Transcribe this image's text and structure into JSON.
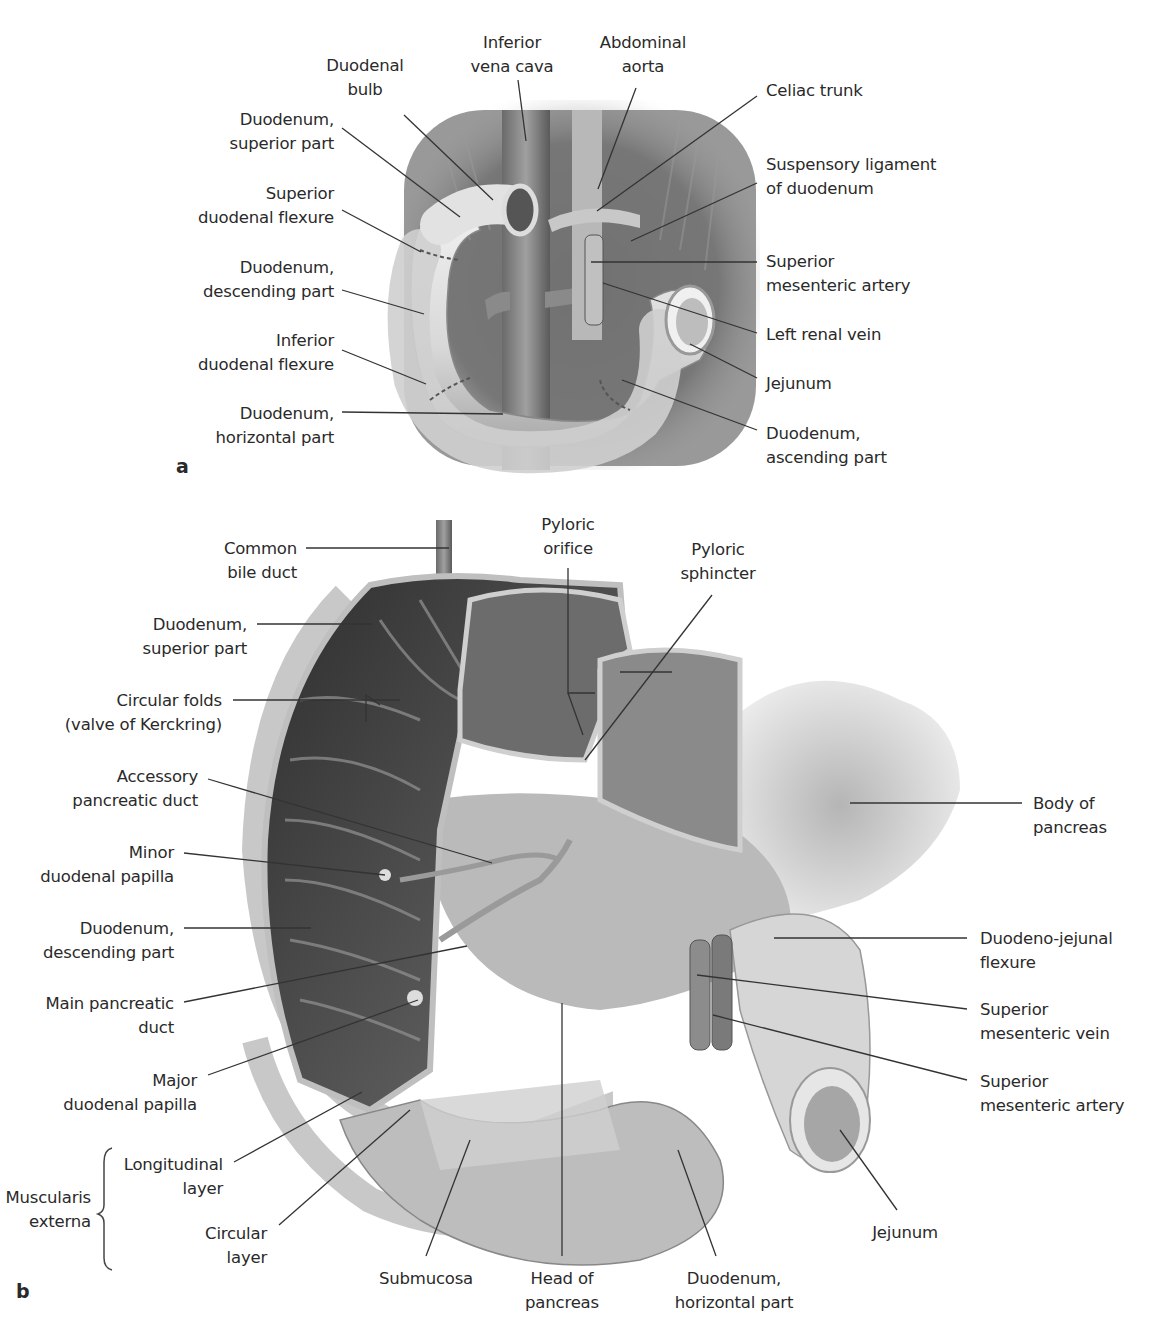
{
  "figure": {
    "panel_a": {
      "letter": "a",
      "labels": {
        "duodenal_bulb": [
          "Duodenal",
          "bulb"
        ],
        "inferior_vena_cava": [
          "Inferior",
          "vena cava"
        ],
        "abdominal_aorta": [
          "Abdominal",
          "aorta"
        ],
        "celiac_trunk": [
          "Celiac trunk"
        ],
        "suspensory_ligament": [
          "Suspensory ligament",
          "of duodenum"
        ],
        "duodenum_superior": [
          "Duodenum,",
          "superior part"
        ],
        "superior_flexure": [
          "Superior",
          "duodenal flexure"
        ],
        "duodenum_descending": [
          "Duodenum,",
          "descending part"
        ],
        "inferior_flexure": [
          "Inferior",
          "duodenal flexure"
        ],
        "duodenum_horizontal": [
          "Duodenum,",
          "horizontal part"
        ],
        "superior_mesenteric_artery": [
          "Superior",
          "mesenteric artery"
        ],
        "left_renal_vein": [
          "Left renal vein"
        ],
        "jejunum": [
          "Jejunum"
        ],
        "duodenum_ascending": [
          "Duodenum,",
          "ascending part"
        ]
      }
    },
    "panel_b": {
      "letter": "b",
      "labels": {
        "common_bile_duct": [
          "Common",
          "bile duct"
        ],
        "pyloric_orifice": [
          "Pyloric",
          "orifice"
        ],
        "pyloric_sphincter": [
          "Pyloric",
          "sphincter"
        ],
        "duodenum_superior": [
          "Duodenum,",
          "superior part"
        ],
        "circular_folds": [
          "Circular folds",
          "(valve of Kerckring)"
        ],
        "accessory_duct": [
          "Accessory",
          "pancreatic duct"
        ],
        "body_pancreas": [
          "Body of",
          "pancreas"
        ],
        "minor_papilla": [
          "Minor",
          "duodenal papilla"
        ],
        "duodenum_descending": [
          "Duodenum,",
          "descending part"
        ],
        "duodenojejunal_flexure": [
          "Duodeno-jejunal",
          "flexure"
        ],
        "main_duct": [
          "Main pancreatic",
          "duct"
        ],
        "superior_mesenteric_vein": [
          "Superior",
          "mesenteric vein"
        ],
        "major_papilla": [
          "Major",
          "duodenal papilla"
        ],
        "superior_mesenteric_artery": [
          "Superior",
          "mesenteric artery"
        ],
        "muscularis_externa": [
          "Muscularis",
          "externa"
        ],
        "longitudinal_layer": [
          "Longitudinal",
          "layer"
        ],
        "circular_layer": [
          "Circular",
          "layer"
        ],
        "submucosa": [
          "Submucosa"
        ],
        "head_pancreas": [
          "Head of",
          "pancreas"
        ],
        "duodenum_horizontal": [
          "Duodenum,",
          "horizontal part"
        ],
        "jejunum": [
          "Jejunum"
        ]
      }
    },
    "colors": {
      "ink": "#2a2a2a",
      "leader": "#333333",
      "tissue_light": "#e6e6e6",
      "tissue_mid": "#9a9a9a",
      "tissue_dark": "#3a3a3a"
    }
  }
}
